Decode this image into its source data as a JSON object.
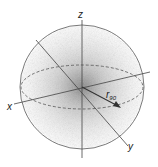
{
  "diagram": {
    "type": "3d-coordinate-sphere-with-gaussian-cloud",
    "axes": {
      "x_label": "x",
      "y_label": "y",
      "z_label": "z"
    },
    "radius_label": "r",
    "radius_subscript": "90",
    "colors": {
      "line": "#555555",
      "cloud": "#8a8a8a",
      "background": "#ffffff"
    }
  }
}
